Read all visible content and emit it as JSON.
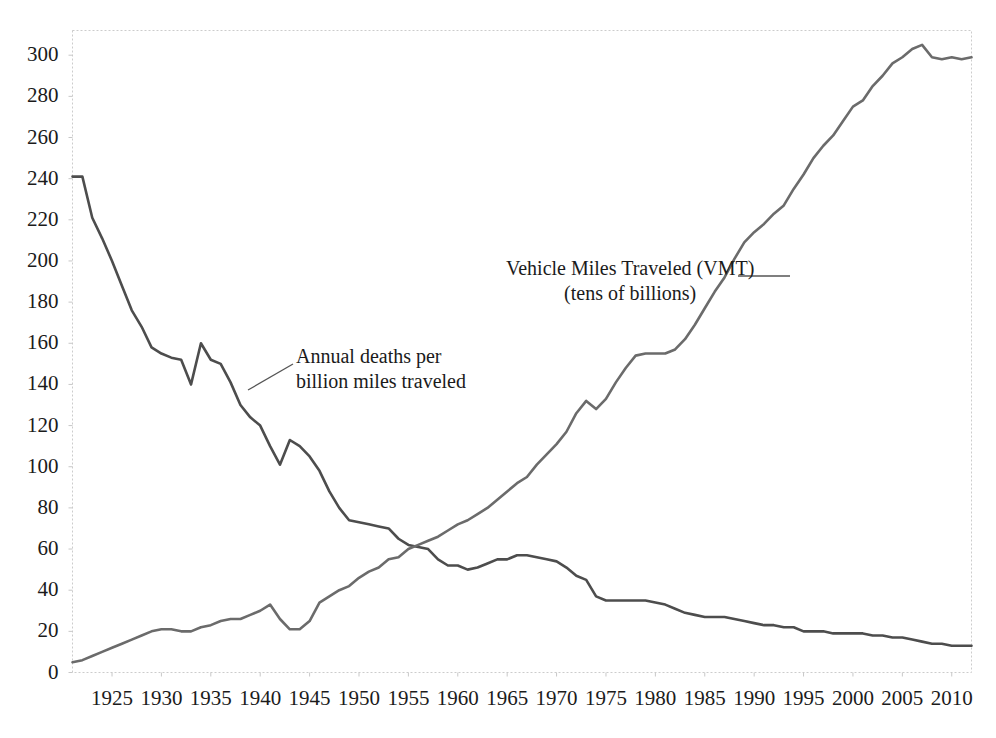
{
  "chart_data": {
    "type": "line",
    "title": "",
    "subtitle": "",
    "xlabel": "",
    "ylabel": "",
    "xlim": [
      1921,
      2012
    ],
    "ylim": [
      0,
      312
    ],
    "grid": false,
    "legend_position": "inline-annotations",
    "xticks": [
      1925,
      1930,
      1935,
      1940,
      1945,
      1950,
      1955,
      1960,
      1965,
      1970,
      1975,
      1980,
      1985,
      1990,
      1995,
      2000,
      2005,
      2010
    ],
    "yticks": [
      0,
      20,
      40,
      60,
      80,
      100,
      120,
      140,
      160,
      180,
      200,
      220,
      240,
      260,
      280,
      300
    ],
    "line_color": "#4d4d4d",
    "axis_color": "#c8c8c8",
    "text_color": "#1b1b1b",
    "series": [
      {
        "name": "Annual deaths per billion miles traveled",
        "x": [
          1921,
          1922,
          1923,
          1924,
          1925,
          1926,
          1927,
          1928,
          1929,
          1930,
          1931,
          1932,
          1933,
          1934,
          1935,
          1936,
          1937,
          1938,
          1939,
          1940,
          1941,
          1942,
          1943,
          1944,
          1945,
          1946,
          1947,
          1948,
          1949,
          1950,
          1951,
          1952,
          1953,
          1954,
          1955,
          1956,
          1957,
          1958,
          1959,
          1960,
          1961,
          1962,
          1963,
          1964,
          1965,
          1966,
          1967,
          1968,
          1969,
          1970,
          1971,
          1972,
          1973,
          1974,
          1975,
          1976,
          1977,
          1978,
          1979,
          1980,
          1981,
          1982,
          1983,
          1984,
          1985,
          1986,
          1987,
          1988,
          1989,
          1990,
          1991,
          1992,
          1993,
          1994,
          1995,
          1996,
          1997,
          1998,
          1999,
          2000,
          2001,
          2002,
          2003,
          2004,
          2005,
          2006,
          2007,
          2008,
          2009,
          2010,
          2011,
          2012
        ],
        "y": [
          241,
          241,
          221,
          211,
          200,
          188,
          176,
          168,
          158,
          155,
          153,
          152,
          140,
          160,
          152,
          150,
          141,
          130,
          124,
          120,
          110,
          101,
          113,
          110,
          105,
          98,
          88,
          80,
          74,
          73,
          72,
          71,
          70,
          65,
          62,
          61,
          60,
          55,
          52,
          52,
          50,
          51,
          53,
          55,
          55,
          57,
          57,
          56,
          55,
          54,
          51,
          47,
          45,
          37,
          35,
          35,
          35,
          35,
          35,
          34,
          33,
          31,
          29,
          28,
          27,
          27,
          27,
          26,
          25,
          24,
          23,
          23,
          22,
          22,
          20,
          20,
          20,
          19,
          19,
          19,
          19,
          18,
          18,
          17,
          17,
          16,
          15,
          14,
          14,
          13,
          13,
          13
        ]
      },
      {
        "name": "Vehicle Miles Traveled (VMT) (tens of billions)",
        "x": [
          1921,
          1922,
          1923,
          1924,
          1925,
          1926,
          1927,
          1928,
          1929,
          1930,
          1931,
          1932,
          1933,
          1934,
          1935,
          1936,
          1937,
          1938,
          1939,
          1940,
          1941,
          1942,
          1943,
          1944,
          1945,
          1946,
          1947,
          1948,
          1949,
          1950,
          1951,
          1952,
          1953,
          1954,
          1955,
          1956,
          1957,
          1958,
          1959,
          1960,
          1961,
          1962,
          1963,
          1964,
          1965,
          1966,
          1967,
          1968,
          1969,
          1970,
          1971,
          1972,
          1973,
          1974,
          1975,
          1976,
          1977,
          1978,
          1979,
          1980,
          1981,
          1982,
          1983,
          1984,
          1985,
          1986,
          1987,
          1988,
          1989,
          1990,
          1991,
          1992,
          1993,
          1994,
          1995,
          1996,
          1997,
          1998,
          1999,
          2000,
          2001,
          2002,
          2003,
          2004,
          2005,
          2006,
          2007,
          2008,
          2009,
          2010,
          2011,
          2012
        ],
        "y": [
          5,
          6,
          8,
          10,
          12,
          14,
          16,
          18,
          20,
          21,
          21,
          20,
          20,
          22,
          23,
          25,
          26,
          26,
          28,
          30,
          33,
          26,
          21,
          21,
          25,
          34,
          37,
          40,
          42,
          46,
          49,
          51,
          55,
          56,
          60,
          62,
          64,
          66,
          69,
          72,
          74,
          77,
          80,
          84,
          88,
          92,
          95,
          101,
          106,
          111,
          117,
          126,
          132,
          128,
          133,
          141,
          148,
          154,
          155,
          155,
          155,
          157,
          162,
          169,
          177,
          185,
          192,
          201,
          209,
          214,
          218,
          223,
          227,
          235,
          242,
          250,
          256,
          261,
          268,
          275,
          278,
          285,
          290,
          296,
          299,
          303,
          305,
          299,
          298,
          299,
          298,
          299
        ]
      }
    ],
    "annotations": [
      {
        "name": "deaths-label",
        "line1": "Annual deaths per",
        "line2": "billion miles traveled",
        "leader": "diagonal"
      },
      {
        "name": "vmt-label",
        "line1": "Vehicle Miles Traveled (VMT)",
        "line2": "(tens of billions)",
        "leader": "horizontal"
      }
    ]
  }
}
